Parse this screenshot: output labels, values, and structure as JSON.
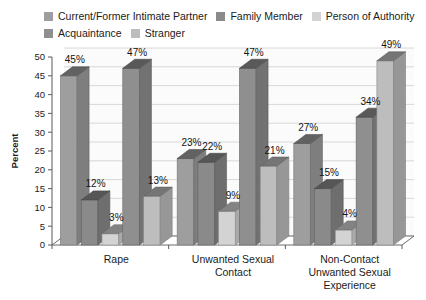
{
  "legend": {
    "rows": [
      [
        {
          "label": "Current/Former Intimate Partner",
          "color": "#9e9e9e"
        },
        {
          "label": "Family Member",
          "color": "#8a8a8a"
        },
        {
          "label": "Person of Authority",
          "color": "#d3d3d3"
        }
      ],
      [
        {
          "label": "Acquaintance",
          "color": "#8f8f8f"
        },
        {
          "label": "Stranger",
          "color": "#bdbdbd"
        }
      ]
    ]
  },
  "axis": {
    "y_title": "Percent",
    "y_ticks": [
      "0",
      "5",
      "10",
      "15",
      "20",
      "25",
      "30",
      "35",
      "40",
      "45",
      "50"
    ]
  },
  "chart_data": {
    "type": "bar",
    "title": "",
    "xlabel": "",
    "ylabel": "Percent",
    "ylim": [
      0,
      50
    ],
    "grid": true,
    "legend_position": "top",
    "three_d": true,
    "categories": [
      "Rape",
      "Unwanted Sexual Contact",
      "Non-Contact Unwanted Sexual Experience"
    ],
    "category_lines": [
      [
        "Rape"
      ],
      [
        "Unwanted Sexual",
        "Contact"
      ],
      [
        "Non-Contact",
        "Unwanted Sexual",
        "Experience"
      ]
    ],
    "series": [
      {
        "name": "Current/Former Intimate Partner",
        "color": "#9e9e9e",
        "values": [
          45,
          23,
          27
        ],
        "labels": [
          "45%",
          "23%",
          "27%"
        ]
      },
      {
        "name": "Family Member",
        "color": "#8a8a8a",
        "values": [
          12,
          22,
          15
        ],
        "labels": [
          "12%",
          "22%",
          "15%"
        ]
      },
      {
        "name": "Person of Authority",
        "color": "#d3d3d3",
        "values": [
          3,
          9,
          4
        ],
        "labels": [
          "3%",
          "9%",
          "4%"
        ]
      },
      {
        "name": "Acquaintance",
        "color": "#8f8f8f",
        "values": [
          47,
          47,
          34
        ],
        "labels": [
          "47%",
          "47%",
          "34%"
        ]
      },
      {
        "name": "Stranger",
        "color": "#bdbdbd",
        "values": [
          13,
          21,
          49
        ],
        "labels": [
          "13%",
          "21%",
          "49%"
        ]
      }
    ]
  }
}
